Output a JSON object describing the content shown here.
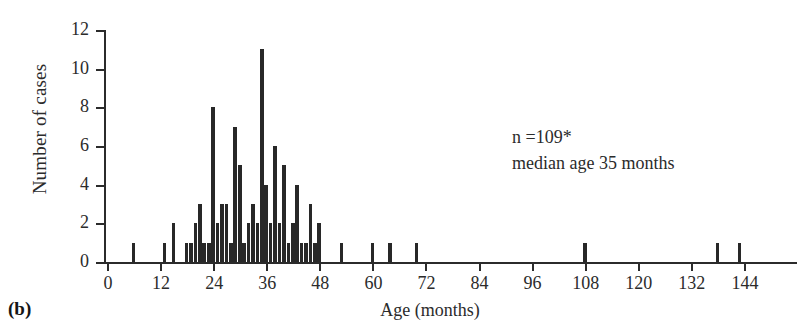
{
  "panel": {
    "label": "(b)"
  },
  "annotation": {
    "line1": "n =109*",
    "line2": "median age 35 months"
  },
  "chart_data": {
    "type": "bar",
    "title": "",
    "subtitle": "",
    "xlabel": "Age (months)",
    "ylabel": "Number of cases",
    "xlim": [
      0,
      156
    ],
    "ylim": [
      0,
      12
    ],
    "grid": false,
    "legend": "none",
    "bar_color": "#282828",
    "axis_color": "#2b2b2b",
    "xticks": [
      0,
      12,
      24,
      36,
      48,
      60,
      72,
      84,
      96,
      108,
      120,
      132,
      144
    ],
    "xtick_labels": [
      "0",
      "12",
      "24",
      "36",
      "48",
      "60",
      "72",
      "84",
      "96",
      "108",
      "120",
      "132",
      "144"
    ],
    "yticks": [
      0,
      2,
      4,
      6,
      8,
      10,
      12
    ],
    "ytick_labels": [
      "0",
      "2",
      "4",
      "6",
      "8",
      "10",
      "12"
    ],
    "bin_width_months": 1,
    "categories": [
      6,
      13,
      15,
      18,
      19,
      20,
      21,
      22,
      23,
      24,
      25,
      26,
      27,
      28,
      29,
      30,
      31,
      32,
      33,
      34,
      35,
      36,
      37,
      38,
      39,
      40,
      41,
      42,
      43,
      44,
      45,
      46,
      47,
      48,
      53,
      60,
      64,
      70,
      108,
      138,
      143
    ],
    "values": [
      1,
      1,
      2,
      1,
      1,
      2,
      3,
      1,
      1,
      8,
      2,
      3,
      3,
      1,
      7,
      5,
      1,
      2,
      3,
      2,
      11,
      4,
      2,
      6,
      2,
      5,
      1,
      2,
      4,
      1,
      1,
      3,
      1,
      2,
      1,
      1,
      1,
      1,
      1,
      1,
      1
    ]
  }
}
